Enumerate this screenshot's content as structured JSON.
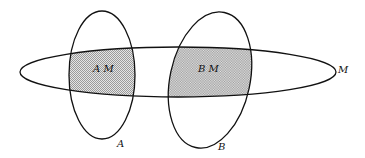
{
  "diagram": {
    "type": "venn",
    "sets": [
      {
        "id": "A",
        "label": "A"
      },
      {
        "id": "B",
        "label": "B"
      },
      {
        "id": "M",
        "label": "M"
      }
    ],
    "regions": [
      {
        "id": "AM",
        "label": "A M",
        "shaded": true
      },
      {
        "id": "BM",
        "label": "B M",
        "shaded": true
      }
    ],
    "colors": {
      "stroke": "#111111",
      "shade": "#c8c8c8",
      "background": "#ffffff"
    }
  }
}
